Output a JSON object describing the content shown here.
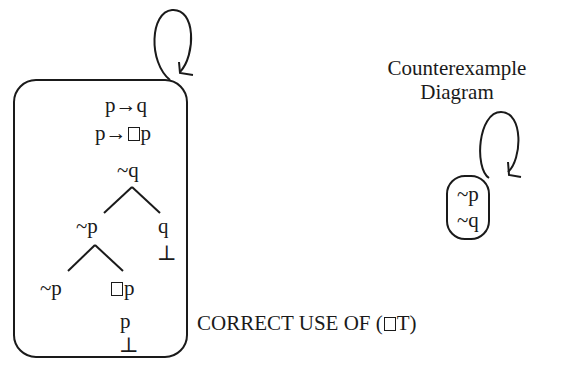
{
  "tree_world": {
    "lines": [
      "p→q",
      "p→□p",
      "~q"
    ],
    "left_branch": "~p",
    "right_branch": "q",
    "right_close": "⊥",
    "left_left": "~p",
    "left_right_box": "p",
    "left_right_p": "p",
    "left_right_close": "⊥"
  },
  "caption": {
    "prefix": "CORRECT USE OF (",
    "suffix": "T)"
  },
  "counterexample": {
    "title_line1": "Counterexample",
    "title_line2": "Diagram",
    "world_lines": [
      "~p",
      "~q"
    ]
  }
}
